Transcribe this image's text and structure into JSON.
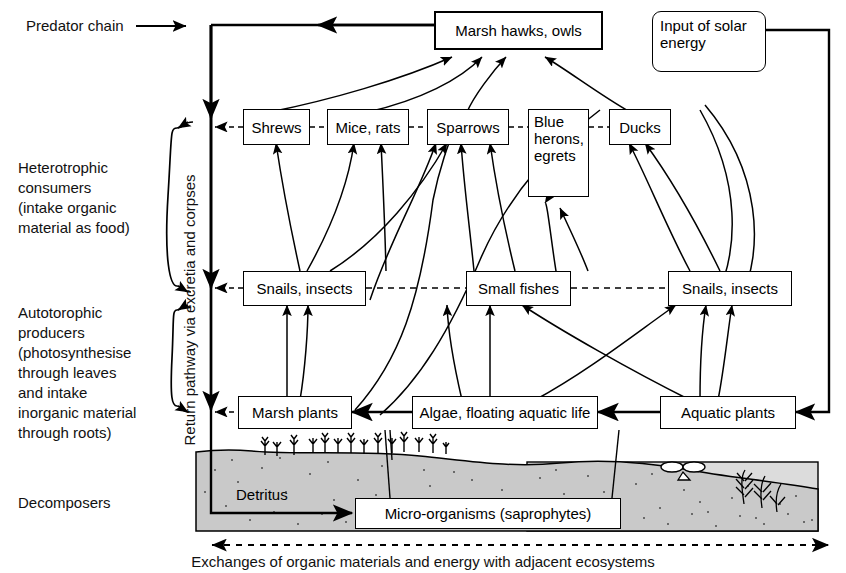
{
  "diagram": {
    "title_labels": {
      "predator_chain": "Predator chain",
      "heterotrophic": "Heterotrophic\nconsumers\n(intake organic\nmaterial as food)",
      "autotrophic": "Autotorophic\nproducers\n(photosynthesise\nthrough leaves\nand intake\ninorganic material\nthrough roots)",
      "decomposers": "Decomposers",
      "return_pathway": "Return pathway via excretia and corpses",
      "bottom_exchange": "Exchanges of organic materials and energy with adjacent ecosystems"
    },
    "nodes": {
      "top_predator": "Marsh hawks, owls",
      "solar": "Input of solar\nenergy",
      "consumers": [
        "Shrews",
        "Mice, rats",
        "Sparrows",
        "Blue\nherons,\negrets",
        "Ducks"
      ],
      "middle": [
        "Snails, insects",
        "Small fishes",
        "Snails, insects"
      ],
      "producers": [
        "Marsh plants",
        "Algae, floating aquatic life",
        "Aquatic plants"
      ],
      "detritus": "Detritus",
      "micro": "Micro-organisms (saprophytes)"
    },
    "colors": {
      "line": "#000000",
      "soil_fill": "#c9c9c9",
      "water_fill": "#dcdcdc",
      "box_fill": "#ffffff",
      "text": "#111111"
    }
  }
}
